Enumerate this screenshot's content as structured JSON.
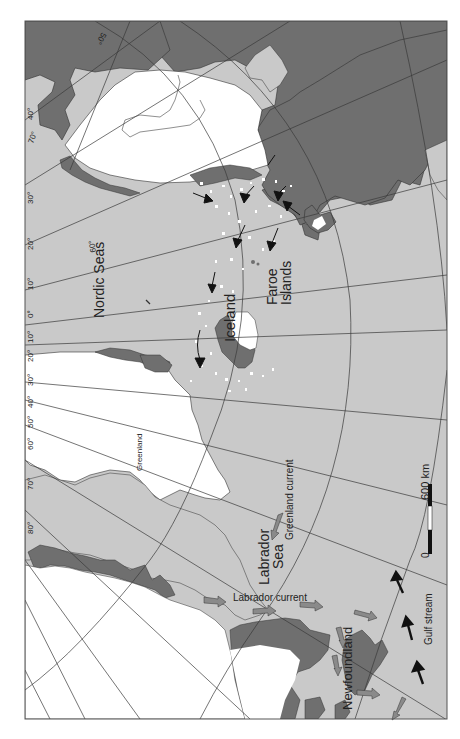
{
  "map": {
    "title": "North Atlantic glacial map",
    "colors": {
      "ocean": "#c9c9c9",
      "land": "#6f6f6f",
      "ice": "#ffffff",
      "grid": "#3a3a3a",
      "frame": "#555555",
      "current_arrow_gray": "#8a8a8a",
      "current_arrow_black": "#111111",
      "iceberg": "#ffffff"
    },
    "labels": {
      "nordic_seas": "Nordic Seas",
      "iceland": "Iceland",
      "faroe_line1": "Faroe",
      "faroe_line2": "Islands",
      "greenland": "Greenland",
      "greenland_current": "Greenland current",
      "labrador_sea_line1": "Labrador",
      "labrador_sea_line2": "Sea",
      "labrador_current": "Labrador current",
      "newfoundland": "Newfoundland",
      "gulf_stream": "Gulf stream"
    },
    "latitude_labels": [
      "50°",
      "60°"
    ],
    "longitude_labels": [
      "40°",
      "70°",
      "30°",
      "20°",
      "10°",
      "0°",
      "10°",
      "20°",
      "30°",
      "40°",
      "50°",
      "60°",
      "70°",
      "80°"
    ],
    "scale_bar": {
      "start": "0",
      "end": "600 km"
    }
  }
}
